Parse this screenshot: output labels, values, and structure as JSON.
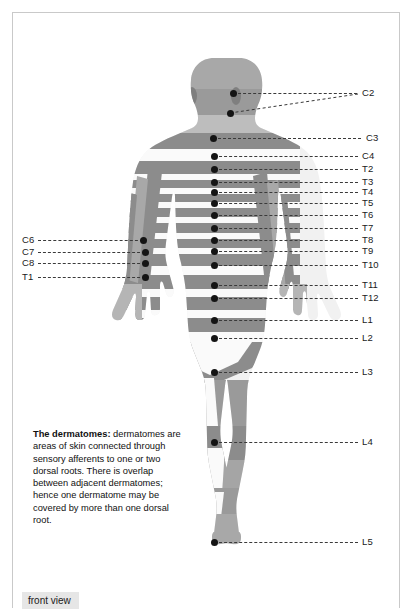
{
  "figure": {
    "view_label": "front view",
    "caption_lead": "The dermatomes:",
    "caption_body": " dermatomes are areas of skin connected through sensory afferents to one or two dorsal roots. There is overlap between adjacent dermatomes; hence one dermatome may be covered by more than one dorsal root.",
    "colors": {
      "band_gray": "#8a8a8a",
      "skin_light": "#f2f2f2",
      "dot": "#141414",
      "leader": "#3a3a3a",
      "frame": "#c9c9c9",
      "view_label_bg": "#e6e6e6"
    }
  },
  "labels_right": [
    {
      "id": "C2",
      "text": "C2",
      "y": 93,
      "x": 362
    },
    {
      "id": "C3",
      "text": "C3",
      "y": 138,
      "x": 366
    },
    {
      "id": "C4",
      "text": "C4",
      "y": 156,
      "x": 362
    },
    {
      "id": "T2",
      "text": "T2",
      "y": 169,
      "x": 362
    },
    {
      "id": "T3",
      "text": "T3",
      "y": 182,
      "x": 362
    },
    {
      "id": "T4",
      "text": "T4",
      "y": 192,
      "x": 362
    },
    {
      "id": "T5",
      "text": "T5",
      "y": 203,
      "x": 362
    },
    {
      "id": "T6",
      "text": "T6",
      "y": 215,
      "x": 362
    },
    {
      "id": "T7",
      "text": "T7",
      "y": 228,
      "x": 362
    },
    {
      "id": "T8",
      "text": "T8",
      "y": 240,
      "x": 362
    },
    {
      "id": "T9",
      "text": "T9",
      "y": 251,
      "x": 362
    },
    {
      "id": "T10",
      "text": "T10",
      "y": 265,
      "x": 362
    },
    {
      "id": "T11",
      "text": "T11",
      "y": 285,
      "x": 362
    },
    {
      "id": "T12",
      "text": "T12",
      "y": 298,
      "x": 362
    },
    {
      "id": "L1",
      "text": "L1",
      "y": 320,
      "x": 362
    },
    {
      "id": "L2",
      "text": "L2",
      "y": 338,
      "x": 362
    },
    {
      "id": "L3",
      "text": "L3",
      "y": 372,
      "x": 362
    },
    {
      "id": "L4",
      "text": "L4",
      "y": 442,
      "x": 362
    },
    {
      "id": "L5",
      "text": "L5",
      "y": 542,
      "x": 362
    }
  ],
  "labels_left": [
    {
      "id": "C6",
      "text": "C6",
      "y": 240,
      "x": 22
    },
    {
      "id": "C7",
      "text": "C7",
      "y": 252,
      "x": 22
    },
    {
      "id": "C8",
      "text": "C8",
      "y": 263,
      "x": 22
    },
    {
      "id": "T1",
      "text": "T1",
      "y": 277,
      "x": 22
    }
  ],
  "dots_right": [
    {
      "id": "C2a",
      "x": 233,
      "y": 93
    },
    {
      "id": "C2b",
      "x": 230,
      "y": 113
    },
    {
      "id": "C3",
      "x": 213,
      "y": 138
    },
    {
      "id": "C4",
      "x": 214,
      "y": 156
    },
    {
      "id": "T2",
      "x": 214,
      "y": 169
    },
    {
      "id": "T3",
      "x": 214,
      "y": 182
    },
    {
      "id": "T4",
      "x": 214,
      "y": 192
    },
    {
      "id": "T5",
      "x": 214,
      "y": 203
    },
    {
      "id": "T6",
      "x": 214,
      "y": 215
    },
    {
      "id": "T7",
      "x": 214,
      "y": 228
    },
    {
      "id": "T8",
      "x": 214,
      "y": 240
    },
    {
      "id": "T9",
      "x": 214,
      "y": 251
    },
    {
      "id": "T10",
      "x": 214,
      "y": 265
    },
    {
      "id": "T11",
      "x": 214,
      "y": 285
    },
    {
      "id": "T12",
      "x": 214,
      "y": 298
    },
    {
      "id": "L1",
      "x": 214,
      "y": 320
    },
    {
      "id": "L2",
      "x": 214,
      "y": 338
    },
    {
      "id": "L3",
      "x": 214,
      "y": 372
    },
    {
      "id": "L4",
      "x": 214,
      "y": 442
    },
    {
      "id": "L5",
      "x": 214,
      "y": 542
    }
  ],
  "dots_left": [
    {
      "id": "C6",
      "x": 143,
      "y": 240
    },
    {
      "id": "C7",
      "x": 145,
      "y": 252
    },
    {
      "id": "C8",
      "x": 145,
      "y": 263
    },
    {
      "id": "T1",
      "x": 145,
      "y": 277
    }
  ]
}
